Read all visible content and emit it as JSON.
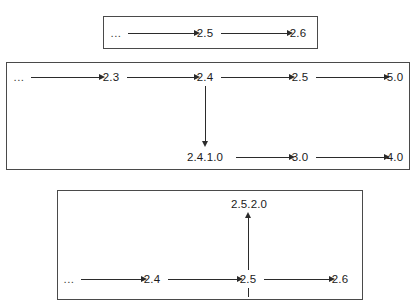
{
  "diagram": {
    "type": "version-branch-graph",
    "background_color": "#ffffff",
    "line_color": "#2b2b2b",
    "box_border_color": "#4a4a4a",
    "text_color": "#1b1b1b",
    "boxes": [
      {
        "id": "box-1",
        "rect": {
          "x": 103,
          "y": 16,
          "w": 215,
          "h": 33
        },
        "nodes": [
          {
            "id": "b1-n0",
            "label": "...",
            "x": 116,
            "y": 33,
            "is_ellipsis": true
          },
          {
            "id": "b1-n1",
            "label": "2.5",
            "x": 205,
            "y": 33,
            "is_ellipsis": false
          },
          {
            "id": "b1-n2",
            "label": "2.6",
            "x": 298,
            "y": 33,
            "is_ellipsis": false
          }
        ],
        "edges": [
          {
            "from": "b1-n0",
            "to": "b1-n1",
            "dir": "right"
          },
          {
            "from": "b1-n1",
            "to": "b1-n2",
            "dir": "right"
          }
        ]
      },
      {
        "id": "box-2",
        "rect": {
          "x": 6,
          "y": 62,
          "w": 404,
          "h": 108
        },
        "nodes": [
          {
            "id": "b2-n0",
            "label": "...",
            "x": 19,
            "y": 77,
            "is_ellipsis": true
          },
          {
            "id": "b2-n1",
            "label": "2.3",
            "x": 111,
            "y": 77,
            "is_ellipsis": false
          },
          {
            "id": "b2-n2",
            "label": "2.4",
            "x": 205,
            "y": 77,
            "is_ellipsis": false
          },
          {
            "id": "b2-n3",
            "label": "2.5",
            "x": 300,
            "y": 77,
            "is_ellipsis": false
          },
          {
            "id": "b2-n4",
            "label": "5.0",
            "x": 395,
            "y": 77,
            "is_ellipsis": false
          },
          {
            "id": "b2-n5",
            "label": "2.4.1.0",
            "x": 205,
            "y": 157,
            "is_ellipsis": false
          },
          {
            "id": "b2-n6",
            "label": "3.0",
            "x": 300,
            "y": 157,
            "is_ellipsis": false
          },
          {
            "id": "b2-n7",
            "label": "4.0",
            "x": 395,
            "y": 157,
            "is_ellipsis": false
          }
        ],
        "edges": [
          {
            "from": "b2-n0",
            "to": "b2-n1",
            "dir": "right"
          },
          {
            "from": "b2-n1",
            "to": "b2-n2",
            "dir": "right"
          },
          {
            "from": "b2-n2",
            "to": "b2-n3",
            "dir": "right"
          },
          {
            "from": "b2-n3",
            "to": "b2-n4",
            "dir": "right"
          },
          {
            "from": "b2-n2",
            "to": "b2-n5",
            "dir": "down"
          },
          {
            "from": "b2-n5",
            "to": "b2-n6",
            "dir": "right"
          },
          {
            "from": "b2-n6",
            "to": "b2-n7",
            "dir": "right"
          }
        ]
      },
      {
        "id": "box-3",
        "rect": {
          "x": 57,
          "y": 190,
          "w": 306,
          "h": 107
        },
        "nodes": [
          {
            "id": "b3-n0",
            "label": "...",
            "x": 69,
            "y": 279,
            "is_ellipsis": true
          },
          {
            "id": "b3-n1",
            "label": "2.4",
            "x": 152,
            "y": 279,
            "is_ellipsis": false
          },
          {
            "id": "b3-n2",
            "label": "2.5",
            "x": 248,
            "y": 279,
            "is_ellipsis": false
          },
          {
            "id": "b3-n3",
            "label": "2.6",
            "x": 340,
            "y": 279,
            "is_ellipsis": false
          },
          {
            "id": "b3-n4",
            "label": "2.5.2.0",
            "x": 249,
            "y": 204,
            "is_ellipsis": false
          }
        ],
        "edges": [
          {
            "from": "b3-n0",
            "to": "b3-n1",
            "dir": "right"
          },
          {
            "from": "b3-n1",
            "to": "b3-n2",
            "dir": "right"
          },
          {
            "from": "b3-n2",
            "to": "b3-n3",
            "dir": "right"
          },
          {
            "from": "b3-n2",
            "to": "b3-n4",
            "dir": "up"
          }
        ]
      }
    ]
  }
}
